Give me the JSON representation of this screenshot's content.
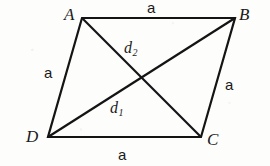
{
  "figure": {
    "name": "rhombus-ABCD-with-diagonals",
    "background_color": "#fdfdfc",
    "stroke_color": "#141414",
    "stroke_width": 2.2,
    "vertices": [
      {
        "name": "A",
        "label": "A",
        "x": 82,
        "y": 18,
        "label_x": 64,
        "label_y": 6
      },
      {
        "name": "B",
        "label": "B",
        "x": 235,
        "y": 18,
        "label_x": 239,
        "label_y": 6
      },
      {
        "name": "C",
        "label": "C",
        "x": 201,
        "y": 137,
        "label_x": 207,
        "label_y": 131
      },
      {
        "name": "D",
        "label": "D",
        "x": 48,
        "y": 137,
        "label_x": 26,
        "label_y": 128
      }
    ],
    "sides": [
      {
        "name": "side-AB",
        "label": "a",
        "from": "A",
        "to": "B",
        "label_x": 147,
        "label_y": 0
      },
      {
        "name": "side-BC",
        "label": "a",
        "from": "B",
        "to": "C",
        "label_x": 225,
        "label_y": 77
      },
      {
        "name": "side-DC",
        "label": "a",
        "from": "D",
        "to": "C",
        "label_x": 118,
        "label_y": 147
      },
      {
        "name": "side-AD",
        "label": "a",
        "from": "A",
        "to": "D",
        "label_x": 44,
        "label_y": 65
      }
    ],
    "diagonals": [
      {
        "name": "diagonal-DB",
        "symbol": "d",
        "subscript": "1",
        "from": "D",
        "to": "B",
        "label_x": 110,
        "label_y": 100
      },
      {
        "name": "diagonal-AC",
        "symbol": "d",
        "subscript": "2",
        "from": "A",
        "to": "C",
        "label_x": 124,
        "label_y": 40
      }
    ],
    "intersection": {
      "x": 141,
      "y": 78
    }
  }
}
